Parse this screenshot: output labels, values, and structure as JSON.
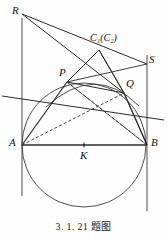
{
  "figure": {
    "caption": "3. 1. 21 题图",
    "stroke_color": "#2b2b2b",
    "axis_color": "#555555",
    "background": "#fefefe",
    "labels": {
      "R": "R",
      "P": "P",
      "Q": "Q",
      "S": "S",
      "A": "A",
      "B": "B",
      "K": "K",
      "C": "C",
      "C_sub1": "1",
      "C_paren_open": "(",
      "C_paren_close": ")",
      "C_sub2": "2",
      "C_combined": "C₁(C₂)"
    },
    "points": {
      "R": {
        "x": 22,
        "y": 14
      },
      "C1": {
        "x": 99,
        "y": 50
      },
      "S": {
        "x": 147,
        "y": 64
      },
      "P": {
        "x": 67,
        "y": 82
      },
      "Q": {
        "x": 124,
        "y": 93
      },
      "A": {
        "x": 22,
        "y": 145
      },
      "B": {
        "x": 147,
        "y": 145
      },
      "K": {
        "x": 84,
        "y": 145
      }
    },
    "circles": [
      {
        "name": "main-circle-K",
        "cx": 84,
        "cy": 145,
        "r": 62
      },
      {
        "name": "arc-circle-C2",
        "through": [
          "P",
          "Q"
        ],
        "bulge": "up"
      }
    ],
    "segments": [
      "R-A (vertical tangent line at A)",
      "S-B (vertical tangent line at B)",
      "A-B (diameter)",
      "R-C1-S",
      "R-Q",
      "C1-P",
      "C1-Q",
      "A-P",
      "A-Q (dashed)",
      "B-Q",
      "B-P (dashed)",
      "P-Q extended both ways"
    ],
    "label_positions": {
      "R": {
        "x": 12,
        "y": 4
      },
      "C1": {
        "x": 92,
        "y": 33
      },
      "S": {
        "x": 150,
        "y": 54
      },
      "P": {
        "x": 60,
        "y": 68
      },
      "Q": {
        "x": 126,
        "y": 80
      },
      "A": {
        "x": 10,
        "y": 138
      },
      "B": {
        "x": 151,
        "y": 138
      },
      "K": {
        "x": 80,
        "y": 150
      }
    }
  }
}
